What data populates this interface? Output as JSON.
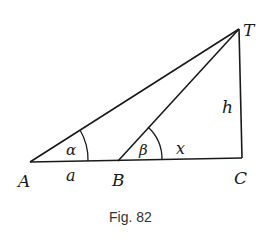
{
  "figure": {
    "caption": "Fig. 82",
    "points": {
      "A": "A",
      "B": "B",
      "C": "C",
      "T": "T"
    },
    "segments": {
      "AB": "a",
      "BC": "x",
      "CT": "h"
    },
    "angles": {
      "at_A": "α",
      "at_B": "β"
    },
    "colors": {
      "stroke": "#1a1a1a",
      "background": "#ffffff"
    }
  }
}
